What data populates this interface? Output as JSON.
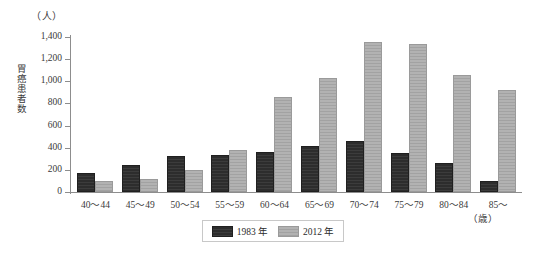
{
  "chart_data": {
    "type": "bar",
    "title": "",
    "unit_label": "（人）",
    "ylabel": "胃癌患者数",
    "xlabel": "（歳）",
    "categories": [
      "40〜44",
      "45〜49",
      "50〜54",
      "55〜59",
      "60〜64",
      "65〜69",
      "70〜74",
      "75〜79",
      "80〜84",
      "85〜"
    ],
    "series": [
      {
        "name": "1983 年",
        "color": "#2f2f2f",
        "values": [
          150,
          225,
          310,
          315,
          340,
          395,
          445,
          330,
          245,
          85
        ]
      },
      {
        "name": "2012 年",
        "color": "#acacac",
        "values": [
          80,
          100,
          180,
          365,
          840,
          1015,
          1335,
          1320,
          1035,
          900
        ]
      }
    ],
    "yticks": [
      "0",
      "200",
      "400",
      "600",
      "800",
      "1,000",
      "1,200",
      "1,400"
    ],
    "ytick_values": [
      0,
      200,
      400,
      600,
      800,
      1000,
      1200,
      1400
    ],
    "ylim": [
      0,
      1400
    ],
    "grid": false,
    "legend_position": "bottom-center"
  },
  "legend": {
    "items": [
      {
        "label": "1983 年"
      },
      {
        "label": "2012 年"
      }
    ]
  }
}
